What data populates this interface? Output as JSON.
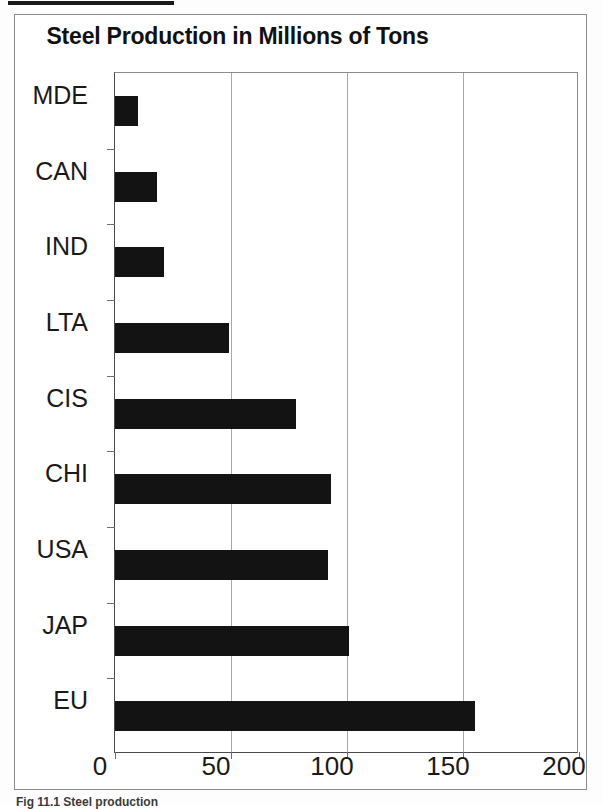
{
  "page": {
    "caption": "Fig 11.1 Steel production",
    "top_rule": "horizontal-rule"
  },
  "chart_data": {
    "type": "bar",
    "orientation": "horizontal",
    "title": "Steel Production in Millions of Tons",
    "xlabel": "",
    "ylabel": "",
    "categories": [
      "MDE",
      "CAN",
      "IND",
      "LTA",
      "CIS",
      "CHI",
      "USA",
      "JAP",
      "EU"
    ],
    "values": [
      10,
      18,
      21,
      49,
      78,
      93,
      92,
      101,
      155
    ],
    "xlim": [
      0,
      200
    ],
    "xticks": [
      0,
      50,
      100,
      150,
      200
    ],
    "xtick_labels": [
      "0",
      "50",
      "100",
      "150",
      "200"
    ],
    "grid": true,
    "grid_axis": "x",
    "legend": false,
    "bar_color": "#131313",
    "series": [
      {
        "name": "Steel Production",
        "values": [
          10,
          18,
          21,
          49,
          78,
          93,
          92,
          101,
          155
        ]
      }
    ]
  }
}
